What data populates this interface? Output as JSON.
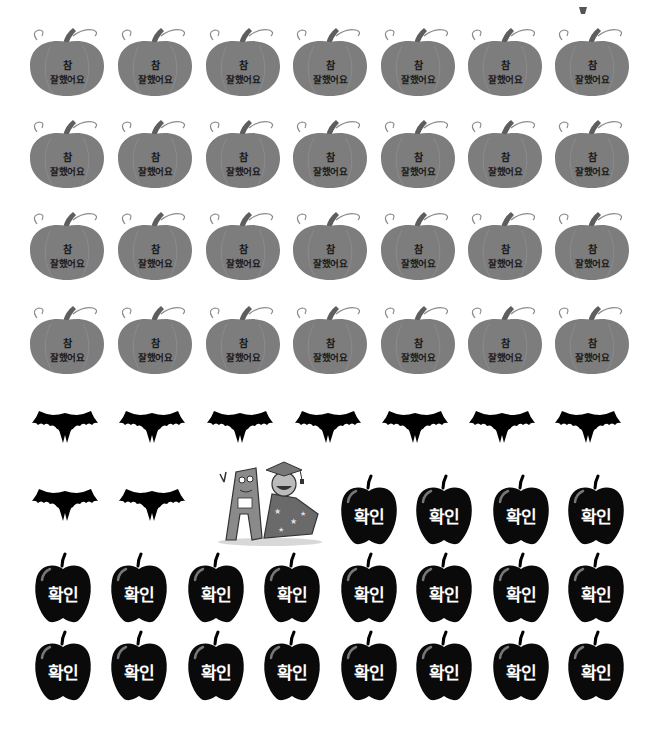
{
  "page": {
    "background": "#ffffff"
  },
  "colors": {
    "pumpkin_body": "#7d7d7d",
    "pumpkin_stem": "#5e5e5e",
    "pumpkin_text": "#1a1a1a",
    "bat": "#000000",
    "apple": "#0a0a0a",
    "apple_text": "#ffffff"
  },
  "pumpkin_stickers": {
    "icon": "pumpkin-icon",
    "line1": "참",
    "line2": "잘했어요",
    "rows": 4,
    "columns": 7
  },
  "bat_stickers": {
    "icon": "bat-icon",
    "count": 9
  },
  "character": {
    "icon": "letter-a-and-wizard-character",
    "description": "Letter A character with wizard in graduation cap"
  },
  "apple_stickers": {
    "icon": "apple-icon",
    "label": "확인",
    "count": 20
  }
}
